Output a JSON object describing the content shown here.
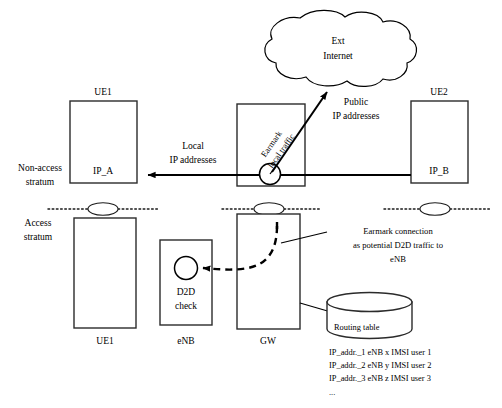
{
  "diagram": {
    "strata": {
      "non_access_label_line1": "Non-access",
      "non_access_label_line2": "stratum",
      "access_label_line1": "Access",
      "access_label_line2": "stratum"
    },
    "cloud": {
      "line1": "Ext",
      "line2": "Internet"
    },
    "nodes": {
      "ue1_top_title": "UE1",
      "ue1_top_ip": "IP_A",
      "ue2_top_title": "UE2",
      "ue2_top_ip": "IP_B",
      "ue1_bottom_label": "UE1",
      "enb_label": "eNB",
      "gw_label": "GW",
      "d2d_line1": "D2D",
      "d2d_line2": "check"
    },
    "flows": {
      "local_line1": "Local",
      "local_line2": "IP addresses",
      "public_line1": "Public",
      "public_line2": "IP addresses",
      "earmark_local_traffic_line1": "Earmark",
      "earmark_local_traffic_line2": "local traffic"
    },
    "annotation": {
      "line1": "Earmark connection",
      "line2": "as potential D2D traffic to",
      "line3": "eNB"
    },
    "routing_table": {
      "title": "Routing table",
      "rows": [
        "IP_addr._1  eNB x  IMSI user 1",
        "IP_addr._2  eNB y  IMSI user 2",
        "IP_addr._3  eNB z  IMSI user 3"
      ],
      "ellipsis": "..."
    },
    "colors": {
      "stroke": "#000000",
      "box_stroke": "#2b2b2b",
      "background": "#ffffff"
    }
  }
}
